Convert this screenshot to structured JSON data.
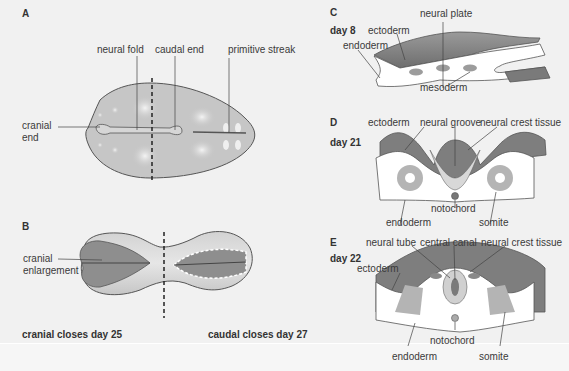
{
  "panels": {
    "A": {
      "letter": "A",
      "labels": {
        "neural_fold": "neural fold",
        "caudal_end": "caudal end",
        "primitive_streak": "primitive streak",
        "cranial_end_line1": "cranial",
        "cranial_end_line2": "end"
      }
    },
    "B": {
      "letter": "B",
      "labels": {
        "cranial_enlargement_line1": "cranial",
        "cranial_enlargement_line2": "enlargement"
      },
      "cranial_closes": "cranial closes day 25",
      "caudal_closes": "caudal closes day 27"
    },
    "C": {
      "letter": "C",
      "day": "day 8",
      "labels": {
        "neural_plate": "neural plate",
        "ectoderm": "ectoderm",
        "endoderm": "endoderm",
        "mesoderm": "mesoderm"
      }
    },
    "D": {
      "letter": "D",
      "day": "day 21",
      "labels": {
        "ectoderm": "ectoderm",
        "neural_groove": "neural groove",
        "neural_crest_tissue": "neural crest tissue",
        "notochord": "notochord",
        "endoderm": "endoderm",
        "somite": "somite"
      }
    },
    "E": {
      "letter": "E",
      "day": "day 22",
      "labels": {
        "neural_tube": "neural tube",
        "central_canal": "central canal",
        "neural_crest_tissue": "neural crest tissue",
        "ectoderm": "ectoderm",
        "notochord": "notochord",
        "endoderm": "endoderm",
        "somite": "somite"
      }
    }
  },
  "colors": {
    "background": "#f1f1f1",
    "embryo_fill": "#c4c4c4",
    "dark_fill": "#8a8a8a",
    "outline": "#555555"
  }
}
